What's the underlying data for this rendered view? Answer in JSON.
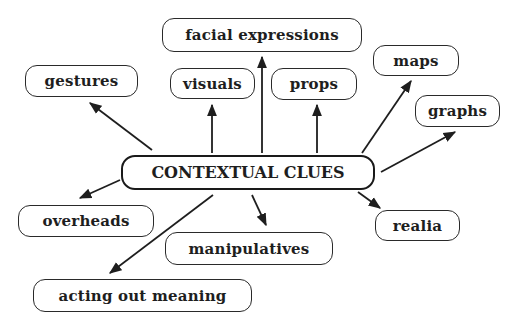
{
  "diagram": {
    "type": "concept-map",
    "center": {
      "label": "CONTEXTUAL CLUES",
      "box": {
        "x": 121,
        "y": 155,
        "w": 254,
        "h": 35
      }
    },
    "nodes": [
      {
        "id": "facial_expressions",
        "label": "facial expressions",
        "box": {
          "x": 162,
          "y": 18,
          "w": 200,
          "h": 34
        }
      },
      {
        "id": "gestures",
        "label": "gestures",
        "box": {
          "x": 25,
          "y": 65,
          "w": 113,
          "h": 32
        }
      },
      {
        "id": "visuals",
        "label": "visuals",
        "box": {
          "x": 170,
          "y": 68,
          "w": 85,
          "h": 31
        }
      },
      {
        "id": "props",
        "label": "props",
        "box": {
          "x": 271,
          "y": 68,
          "w": 86,
          "h": 32
        }
      },
      {
        "id": "maps",
        "label": "maps",
        "box": {
          "x": 373,
          "y": 45,
          "w": 86,
          "h": 31
        }
      },
      {
        "id": "graphs",
        "label": "graphs",
        "box": {
          "x": 415,
          "y": 95,
          "w": 85,
          "h": 32
        }
      },
      {
        "id": "overheads",
        "label": "overheads",
        "box": {
          "x": 18,
          "y": 205,
          "w": 136,
          "h": 32
        }
      },
      {
        "id": "manipulatives",
        "label": "manipulatives",
        "box": {
          "x": 165,
          "y": 232,
          "w": 168,
          "h": 33
        }
      },
      {
        "id": "realia",
        "label": "realia",
        "box": {
          "x": 375,
          "y": 210,
          "w": 85,
          "h": 31
        }
      },
      {
        "id": "acting_out_meaning",
        "label": "acting out meaning",
        "box": {
          "x": 33,
          "y": 279,
          "w": 219,
          "h": 33
        }
      }
    ],
    "edges": [
      {
        "to": "gestures",
        "x1": 152,
        "y1": 150,
        "x2": 90,
        "y2": 103
      },
      {
        "to": "visuals",
        "x1": 212,
        "y1": 153,
        "x2": 212,
        "y2": 105
      },
      {
        "to": "facial_expressions",
        "x1": 262,
        "y1": 153,
        "x2": 262,
        "y2": 57
      },
      {
        "to": "props",
        "x1": 317,
        "y1": 153,
        "x2": 317,
        "y2": 105
      },
      {
        "to": "maps",
        "x1": 362,
        "y1": 153,
        "x2": 411,
        "y2": 81
      },
      {
        "to": "graphs",
        "x1": 381,
        "y1": 172,
        "x2": 455,
        "y2": 132
      },
      {
        "to": "overheads",
        "x1": 120,
        "y1": 180,
        "x2": 80,
        "y2": 198
      },
      {
        "to": "acting_out_meaning",
        "x1": 213,
        "y1": 195,
        "x2": 110,
        "y2": 273
      },
      {
        "to": "manipulatives",
        "x1": 252,
        "y1": 195,
        "x2": 266,
        "y2": 225
      },
      {
        "to": "realia",
        "x1": 358,
        "y1": 192,
        "x2": 380,
        "y2": 208
      }
    ],
    "colors": {
      "stroke": "#1e1e1e",
      "background": "#ffffff"
    }
  }
}
